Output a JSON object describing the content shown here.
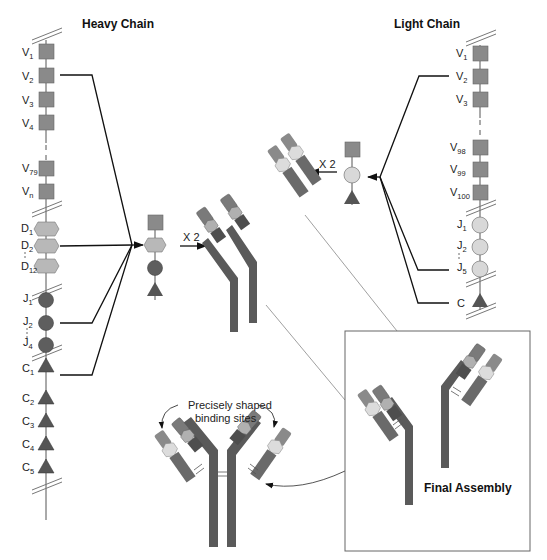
{
  "titles": {
    "heavy": "Heavy Chain",
    "light": "Light Chain",
    "final": "Final Assembly"
  },
  "annotation": {
    "line1": "Precisely shaped",
    "line2": "binding sites"
  },
  "multiplier": {
    "heavy": "X 2",
    "light": "X 2"
  },
  "heavy_chain": {
    "segments": [
      {
        "base": "V",
        "sub": "1"
      },
      {
        "base": "V",
        "sub": "2"
      },
      {
        "base": "V",
        "sub": "3"
      },
      {
        "base": "V",
        "sub": "4"
      },
      {
        "base": "V",
        "sub": "79"
      },
      {
        "base": "V",
        "sub": "n"
      },
      {
        "base": "D",
        "sub": "1"
      },
      {
        "base": "D",
        "sub": "2"
      },
      {
        "base": "D",
        "sub": "12"
      },
      {
        "base": "J",
        "sub": "1"
      },
      {
        "base": "J",
        "sub": "2"
      },
      {
        "base": "J",
        "sub": "4"
      },
      {
        "base": "C",
        "sub": "1"
      },
      {
        "base": "C",
        "sub": "2"
      },
      {
        "base": "C",
        "sub": "3"
      },
      {
        "base": "C",
        "sub": "4"
      },
      {
        "base": "C",
        "sub": "5"
      }
    ]
  },
  "light_chain": {
    "segments": [
      {
        "base": "V",
        "sub": "1"
      },
      {
        "base": "V",
        "sub": "2"
      },
      {
        "base": "V",
        "sub": "3"
      },
      {
        "base": "V",
        "sub": "98"
      },
      {
        "base": "V",
        "sub": "99"
      },
      {
        "base": "V",
        "sub": "100"
      },
      {
        "base": "J",
        "sub": "1"
      },
      {
        "base": "J",
        "sub": "2"
      },
      {
        "base": "J",
        "sub": "5"
      },
      {
        "base": "C",
        "sub": ""
      }
    ]
  },
  "colors": {
    "v_square": "#8a8a8a",
    "d_hex": "#b8b8b8",
    "j_heavy": "#5e5e5e",
    "j_light": "#d8d8d8",
    "c_triangle": "#555555",
    "heavy_body": "#5a5a5a",
    "light_body": "#7a7a7a"
  }
}
